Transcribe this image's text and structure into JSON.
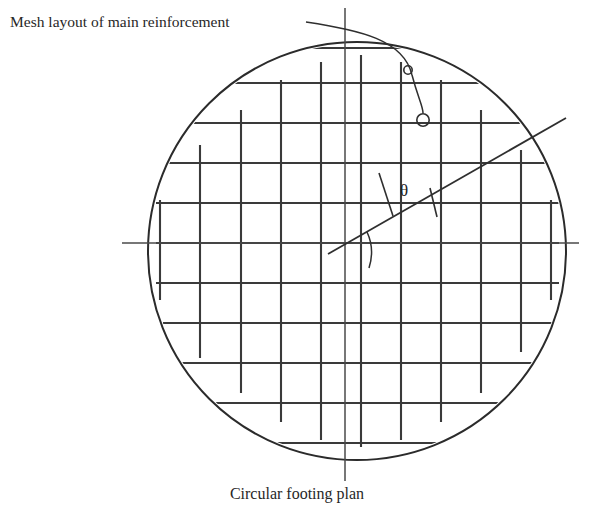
{
  "figure": {
    "annotation_label": "Mesh layout of main reinforcement",
    "caption": "Circular footing plan",
    "angle_symbol": "θ",
    "colors": {
      "line": "#2b2b2b",
      "rebar": "#3a3a3a",
      "centerline": "#4a4a4a",
      "text": "#272727",
      "background": "#ffffff"
    },
    "circle": {
      "cx": 357,
      "cy": 251,
      "r": 209
    },
    "centerlines": {
      "vertical": {
        "x": 345,
        "y1": 8,
        "y2": 481
      },
      "horizontal": {
        "y": 243,
        "x1": 122,
        "x2": 579
      }
    },
    "diagonal": {
      "x1": 328,
      "y1": 254,
      "x2": 566,
      "y2": 118
    },
    "angle": {
      "vertex_x": 393,
      "vertex_y": 216,
      "leg_x": 379,
      "leg_y": 173,
      "tick_x": 437,
      "tick_y": 217,
      "label_x": 404,
      "label_y": 196
    },
    "leader": {
      "start_x": 306,
      "start_y": 22,
      "end_x": 423,
      "end_y": 118,
      "node_small": {
        "cx": 408,
        "cy": 70,
        "r": 4.2
      },
      "node_large": {
        "cx": 423,
        "cy": 120,
        "r": 6.2
      }
    },
    "label_position": {
      "x": 10,
      "y": 27
    },
    "caption_position": {
      "x": 297,
      "y": 499
    },
    "grid": {
      "vertical_bar_x": [
        160,
        200,
        241,
        281,
        321,
        361,
        401,
        441,
        481,
        521,
        561
      ],
      "horizontal_bar_y": [
        48,
        83,
        123,
        163,
        203,
        243,
        283,
        323,
        363,
        403,
        443
      ],
      "spacing_px": 40,
      "bar_count_vertical": 11,
      "bar_count_horizontal": 11
    }
  }
}
